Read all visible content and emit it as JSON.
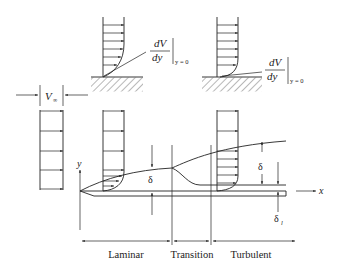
{
  "figure": {
    "background": "#ffffff",
    "ink": "#222222"
  },
  "top_profiles": {
    "laminar_gradient": {
      "numerator": "dV",
      "denominator": "dy",
      "subscript": "y = 0"
    },
    "turbulent_gradient": {
      "numerator": "dV",
      "denominator": "dy",
      "subscript": "y = 0"
    }
  },
  "freestream": {
    "label": "V",
    "subscript": "∞"
  },
  "axes": {
    "y_label": "y",
    "x_label": "x"
  },
  "annotations": {
    "laminar_thickness": "δ",
    "turbulent_thickness": "δ",
    "sublayer_thickness": "δ",
    "sublayer_subscript": "l"
  },
  "regions": [
    {
      "label": "Laminar"
    },
    {
      "label": "Transition"
    },
    {
      "label": "Turbulent"
    }
  ]
}
